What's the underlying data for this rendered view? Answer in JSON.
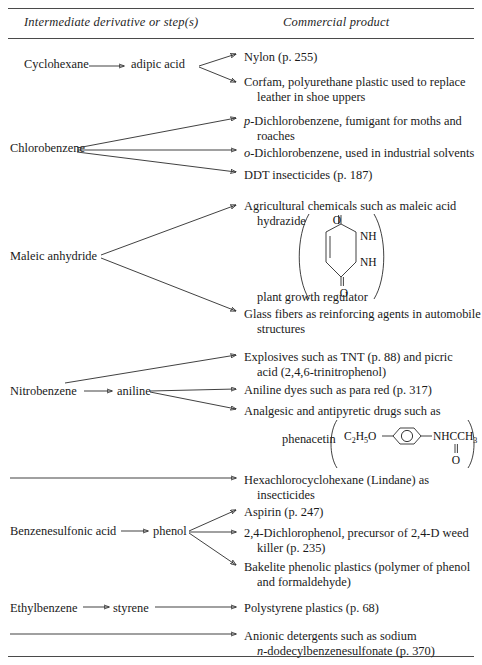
{
  "table": {
    "headers": {
      "left": "Intermediate derivative or step(s)",
      "right": "Commercial product"
    },
    "rows": [
      {
        "id": "cyclohexane",
        "intermediates": [
          "Cyclohexane",
          "adipic acid"
        ],
        "products": [
          {
            "line1": "Nylon (p. 255)",
            "line2": ""
          },
          {
            "line1": "Corfam, polyurethane plastic used to replace",
            "line2": "leather in shoe uppers"
          }
        ]
      },
      {
        "id": "chlorobenzene",
        "intermediates": [
          "Chlorobenzene"
        ],
        "products": [
          {
            "italic_prefix": "p",
            "line1": "-Dichlorobenzene, fumigant for moths and",
            "line2": "roaches"
          },
          {
            "italic_prefix": "o",
            "line1": "-Dichlorobenzene, used in industrial solvents",
            "line2": ""
          },
          {
            "line1": "DDT insecticides (p. 187)",
            "line2": ""
          }
        ]
      },
      {
        "id": "maleic-anhydride",
        "intermediates": [
          "Maleic anhydride"
        ],
        "products": [
          {
            "line1": "Agricultural chemicals such as maleic acid",
            "line2": "hydrazide",
            "line3": "plant growth regulator",
            "structure": "maleic-hydrazide"
          },
          {
            "line1": "Glass fibers as reinforcing agents in automobile",
            "line2": "structures"
          }
        ]
      },
      {
        "id": "nitrobenzene",
        "intermediates": [
          "Nitrobenzene",
          "aniline"
        ],
        "products": [
          {
            "line1": "Explosives such as TNT (p. 88) and picric",
            "line2": "acid (2,4,6-trinitrophenol)"
          },
          {
            "line1": "Aniline dyes such as para red (p. 317)",
            "line2": ""
          },
          {
            "line1": "Analgesic and antipyretic drugs such as",
            "line2": "phenacetin",
            "structure": "phenacetin"
          }
        ]
      },
      {
        "id": "lindane",
        "intermediates": [],
        "products": [
          {
            "line1": "Hexachlorocyclohexane (Lindane) as",
            "line2": "insecticides"
          }
        ]
      },
      {
        "id": "benzenesulfonic-acid",
        "intermediates": [
          "Benzenesulfonic acid",
          "phenol"
        ],
        "products": [
          {
            "line1": "Aspirin (p. 247)",
            "line2": ""
          },
          {
            "line1": "2,4-Dichlorophenol, precursor of 2,4-D weed",
            "line2": "killer (p. 235)"
          },
          {
            "line1": "Bakelite phenolic plastics (polymer of phenol",
            "line2": "and formaldehyde)"
          }
        ]
      },
      {
        "id": "ethylbenzene",
        "intermediates": [
          "Ethylbenzene",
          "styrene"
        ],
        "products": [
          {
            "line1": "Polystyrene plastics (p. 68)",
            "line2": ""
          }
        ]
      },
      {
        "id": "detergents",
        "intermediates": [],
        "products": [
          {
            "line1": "Anionic detergents such as sodium",
            "italic_prefix2": "n",
            "line2": "-dodecylbenzenesulfonate (p. 370)"
          }
        ]
      }
    ]
  },
  "structures": {
    "maleic_hydrazide": {
      "name": "maleic-hydrazide-ring",
      "atoms": [
        "O",
        "NH",
        "NH",
        "O"
      ]
    },
    "phenacetin": {
      "name": "phenacetin-formula",
      "left_group": "C",
      "left_sub1": "2",
      "left_h": "H",
      "left_sub2": "5",
      "left_o": "O",
      "right_group": "NHCCH",
      "right_sub": "3",
      "carbonyl": "O"
    }
  },
  "colors": {
    "ink": "#1a1a1a",
    "rule": "#4a4a4a",
    "background": "#ffffff"
  }
}
